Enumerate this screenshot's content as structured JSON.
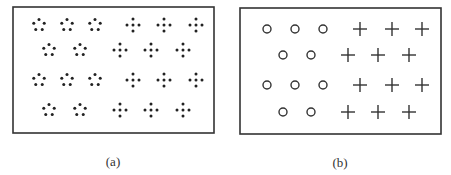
{
  "figure": {
    "panels": [
      {
        "id": "a",
        "caption": "(a)",
        "box": {
          "x": 13,
          "y": 7,
          "w": 201,
          "h": 126
        },
        "element_styles": {
          "left_group": "five-dot-pentagon",
          "right_group": "five-dot-cross"
        },
        "rows": [
          {
            "y": 25,
            "left": [
              39,
              67,
              95
            ],
            "right": [
              133,
              164,
              196
            ]
          },
          {
            "y": 50,
            "left": [
              49,
              80
            ],
            "right": [
              120,
              151,
              183
            ]
          },
          {
            "y": 80,
            "left": [
              39,
              67,
              95
            ],
            "right": [
              133,
              164,
              196
            ]
          },
          {
            "y": 110,
            "left": [
              49,
              80
            ],
            "right": [
              120,
              151,
              183
            ]
          }
        ]
      },
      {
        "id": "b",
        "caption": "(b)",
        "box": {
          "x": 240,
          "y": 8,
          "w": 201,
          "h": 126
        },
        "element_styles": {
          "left_group": "circle",
          "right_group": "plus"
        },
        "rows": [
          {
            "y": 29,
            "left": [
              267,
              295,
              323
            ],
            "right": [
              360,
              392,
              422
            ]
          },
          {
            "y": 55,
            "left": [
              283,
              311
            ],
            "right": [
              348,
              378,
              409
            ]
          },
          {
            "y": 85,
            "left": [
              267,
              295,
              323
            ],
            "right": [
              360,
              392,
              422
            ]
          },
          {
            "y": 112,
            "left": [
              283,
              311
            ],
            "right": [
              348,
              378,
              409
            ]
          }
        ]
      }
    ],
    "colors": {
      "stroke": "#333333",
      "dot": "#222222",
      "background": "#ffffff"
    }
  }
}
